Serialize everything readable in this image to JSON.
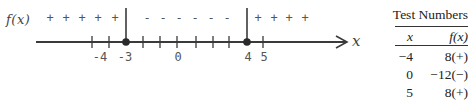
{
  "sign_chart": {
    "function_label": "f(x)",
    "variable_label": "x",
    "critical_points": [
      -3,
      4
    ],
    "tick_labels": [
      {
        "text": "-4",
        "x": 100
      },
      {
        "text": "-3",
        "x": 126
      },
      {
        "text": "0",
        "x": 178
      },
      {
        "text": "4",
        "x": 248
      },
      {
        "text": "5",
        "x": 264
      }
    ],
    "tick_positions": [
      92,
      109,
      143,
      160,
      177,
      196,
      213,
      229,
      263
    ],
    "dot_positions": [
      126,
      247
    ],
    "intervals": [
      {
        "range": "(-inf, -3)",
        "sign": "+",
        "symbols": [
          "+",
          "+",
          "+",
          "+",
          "+"
        ],
        "positions": [
          50,
          66,
          82,
          98,
          115
        ]
      },
      {
        "range": "(-3, 4)",
        "sign": "-",
        "symbols": [
          "-",
          "-",
          "-",
          "-",
          "-",
          "-"
        ],
        "positions": [
          147,
          163,
          179,
          195,
          211,
          227
        ]
      },
      {
        "range": "(4, inf)",
        "sign": "+",
        "symbols": [
          "+",
          "+",
          "+",
          "+"
        ],
        "positions": [
          258,
          274,
          289,
          305
        ]
      }
    ]
  },
  "test_table": {
    "title": "Test Numbers",
    "headers": {
      "x": "x",
      "fx": "f(x)"
    },
    "rows": [
      {
        "x": "−4",
        "fx": "8(+)"
      },
      {
        "x": "0",
        "fx": "−12(−)"
      },
      {
        "x": "5",
        "fx": "8(+)"
      }
    ]
  },
  "colors": {
    "line": "#3a3a3a",
    "text": "#555555"
  }
}
